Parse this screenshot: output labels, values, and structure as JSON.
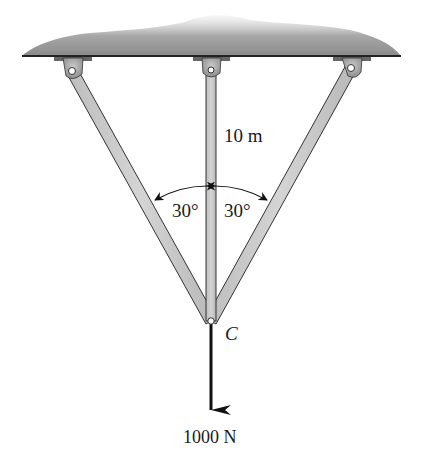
{
  "diagram": {
    "type": "statics-truss",
    "labels": {
      "length": "10 m",
      "angle_left": "30°",
      "angle_right": "30°",
      "pin": "C",
      "load": "1000 N"
    },
    "colors": {
      "bar_fill": "#c8c8c8",
      "bar_stroke": "#333333",
      "ceiling_dark": "#7a7a7a",
      "ceiling_line": "#222222",
      "arrow": "#111111"
    },
    "geometry": {
      "pin_C": [
        211,
        321
      ],
      "support_left": [
        72,
        71
      ],
      "support_center": [
        211,
        70
      ],
      "support_right": [
        351,
        68
      ]
    }
  }
}
